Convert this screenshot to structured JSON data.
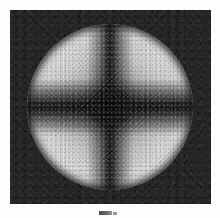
{
  "figure": {
    "name": "conoscopic-interference-figure",
    "kind": "grayscale-micrograph",
    "caption": "Fig.",
    "background_color": "#fdfdfd",
    "panel": {
      "name": "image-panel",
      "background_color": "#262626",
      "x": 10,
      "y": 10,
      "width": 201,
      "height": 194
    },
    "disk": {
      "name": "interference-disk",
      "center_x": 110,
      "center_y": 107,
      "radius": 83,
      "bright_color": "#d8d8d8",
      "mid_color": "#9d9d9d",
      "dark_color": "#2e2e2e"
    },
    "features": {
      "isogyre_vertical": "dark vertical band",
      "isogyre_horizontal": "dark horizontal band",
      "melatope": "dark centre spot at optic axis",
      "quadrant_lobes": 4
    }
  },
  "chart_data": {
    "type": "heatmap",
    "title": "",
    "subtitle": "",
    "xlabel": "",
    "ylabel": "",
    "colormap": "grayscale",
    "grid": false,
    "legend": "none",
    "xlim": [
      -1,
      1
    ],
    "ylim": [
      -1,
      1
    ],
    "angular_profile": {
      "angles_deg": [
        0,
        15,
        30,
        45,
        60,
        75,
        90,
        105,
        120,
        135,
        150,
        165,
        180,
        195,
        210,
        225,
        240,
        255,
        270,
        285,
        300,
        315,
        330,
        345
      ],
      "relative_intensity": [
        0.04,
        0.27,
        0.78,
        1.0,
        0.78,
        0.27,
        0.04,
        0.27,
        0.78,
        1.0,
        0.78,
        0.27,
        0.04,
        0.27,
        0.78,
        1.0,
        0.78,
        0.27,
        0.04,
        0.27,
        0.78,
        1.0,
        0.78,
        0.27
      ]
    },
    "radial_profile": {
      "radius_normalized": [
        0.0,
        0.07,
        0.18,
        0.3,
        0.44,
        0.58,
        0.7,
        0.82,
        0.92,
        0.98,
        1.0
      ],
      "relative_intensity": [
        0.12,
        0.18,
        0.36,
        0.58,
        0.72,
        0.81,
        0.85,
        0.82,
        0.72,
        0.56,
        0.38
      ]
    },
    "gray_levels": {
      "background_plate": 38,
      "cross_minimum": 22,
      "disk_centre": 46,
      "lobe_maximum": 222,
      "rim": 110
    }
  }
}
